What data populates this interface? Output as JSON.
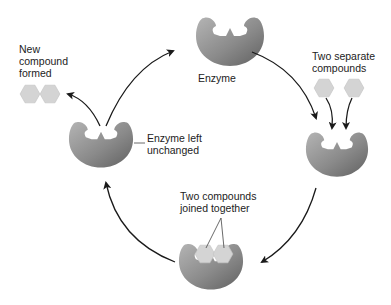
{
  "diagram": {
    "type": "enzyme-reaction-cycle",
    "colors": {
      "enzyme_light": "#a8a8a8",
      "enzyme_dark": "#6e6e6e",
      "compound": "#d4d4d4",
      "compound_stroke": "#c0c0c0",
      "arrow": "#1a1a1a",
      "text": "#222222"
    },
    "labels": {
      "enzyme": "Enzyme",
      "two_separate": "Two separate\ncompounds",
      "joined": "Two compounds\njoined together",
      "unchanged": "Enzyme left\nunchanged",
      "new_compound": "New\ncompound\nformed"
    },
    "nodes": [
      {
        "id": "enzyme",
        "label": "Enzyme",
        "position": "top"
      },
      {
        "id": "binding",
        "label": "Two separate compounds",
        "position": "right"
      },
      {
        "id": "joined",
        "label": "Two compounds joined together",
        "position": "bottom"
      },
      {
        "id": "released",
        "label": "Enzyme left unchanged",
        "position": "left"
      },
      {
        "id": "product",
        "label": "New compound formed",
        "position": "top-left"
      }
    ],
    "cycle_direction": "clockwise"
  }
}
